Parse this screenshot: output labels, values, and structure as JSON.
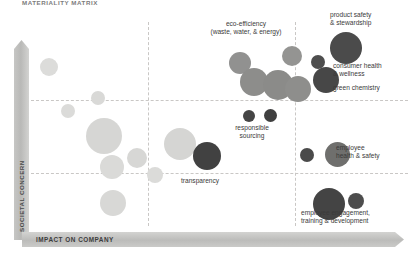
{
  "title": "MATERIALITY MATRIX",
  "axes": {
    "y_label": "SOCIETAL CONCERN",
    "x_label": "IMPACT ON COMPANY"
  },
  "chart_data": {
    "type": "scatter",
    "title": "MATERIALITY MATRIX",
    "xlabel": "IMPACT ON COMPANY",
    "ylabel": "SOCIETAL CONCERN",
    "xlim": [
      0,
      100
    ],
    "ylim": [
      0,
      100
    ],
    "grid": true,
    "gridlines": {
      "vertical": [
        32,
        70
      ],
      "horizontal": [
        38,
        62
      ]
    },
    "legend": "none",
    "size_encoding": "bubble radius = relative materiality weight",
    "color_tiers": {
      "low": "#d8d8d6",
      "medium": "#8f8f8d",
      "high": "#4c4c4c"
    },
    "points": [
      {
        "label": "",
        "x": 10,
        "y": 80,
        "r": 9,
        "tier": "low"
      },
      {
        "label": "",
        "x": 28,
        "y": 67,
        "r": 7,
        "tier": "low"
      },
      {
        "label": "",
        "x": 17,
        "y": 58,
        "r": 7,
        "tier": "low"
      },
      {
        "label": "",
        "x": 33,
        "y": 47,
        "r": 18,
        "tier": "low"
      },
      {
        "label": "",
        "x": 38,
        "y": 27,
        "r": 12,
        "tier": "low"
      },
      {
        "label": "",
        "x": 50,
        "y": 30,
        "r": 10,
        "tier": "low"
      },
      {
        "label": "",
        "x": 56,
        "y": 19,
        "r": 8,
        "tier": "low"
      },
      {
        "label": "",
        "x": 39,
        "y": 8,
        "r": 13,
        "tier": "low"
      },
      {
        "label": "",
        "x": 66,
        "y": 40,
        "r": 16,
        "tier": "low"
      },
      {
        "label": "eco-efficiency\n(waste, water, & energy)",
        "x": 50,
        "y": 74,
        "r": 11,
        "tier": "medium"
      },
      {
        "label": "",
        "x": 58,
        "y": 62,
        "r": 14,
        "tier": "medium"
      },
      {
        "label": "",
        "x": 70,
        "y": 59,
        "r": 15,
        "tier": "medium"
      },
      {
        "label": "",
        "x": 66,
        "y": 76,
        "r": 10,
        "tier": "medium"
      },
      {
        "label": "",
        "x": 79,
        "y": 53,
        "r": 13,
        "tier": "medium"
      },
      {
        "label": "responsible sourcing",
        "x": 56,
        "y": 41,
        "r": 6,
        "tier": "high"
      },
      {
        "label": "",
        "x": 64,
        "y": 41,
        "r": 7,
        "tier": "high"
      },
      {
        "label": "transparency",
        "x": 55,
        "y": 22,
        "r": 14,
        "tier": "high"
      },
      {
        "label": "product safety\n& stewardship",
        "x": 89,
        "y": 74,
        "r": 16,
        "tier": "high"
      },
      {
        "label": "consumer health\n& wellness",
        "x": 81,
        "y": 65,
        "r": 7,
        "tier": "high"
      },
      {
        "label": "green chemistry",
        "x": 75,
        "y": 56,
        "r": 13,
        "tier": "high"
      },
      {
        "label": "employee health & safety",
        "x": 91,
        "y": 39,
        "r": 12,
        "tier": "high"
      },
      {
        "label": "",
        "x": 77,
        "y": 30,
        "r": 7,
        "tier": "high"
      },
      {
        "label": "employee engagement,\ntraining & development",
        "x": 86,
        "y": 17,
        "r": 16,
        "tier": "high"
      },
      {
        "label": "",
        "x": 94,
        "y": 18,
        "r": 8,
        "tier": "high"
      }
    ]
  },
  "bubbles": [
    {
      "name": "bubble-light-1",
      "left": 40,
      "top": 58,
      "size": 18,
      "color": "#dcdcda"
    },
    {
      "name": "bubble-light-2",
      "left": 91,
      "top": 91,
      "size": 14,
      "color": "#d9d9d7"
    },
    {
      "name": "bubble-light-3",
      "left": 61,
      "top": 104,
      "size": 14,
      "color": "#dbdbd9"
    },
    {
      "name": "bubble-light-4",
      "left": 86,
      "top": 118,
      "size": 36,
      "color": "#d6d6d4"
    },
    {
      "name": "bubble-light-5",
      "left": 100,
      "top": 155,
      "size": 24,
      "color": "#dadad8"
    },
    {
      "name": "bubble-light-6",
      "left": 127,
      "top": 148,
      "size": 20,
      "color": "#d7d7d5"
    },
    {
      "name": "bubble-light-7",
      "left": 147,
      "top": 167,
      "size": 16,
      "color": "#dbdbd9"
    },
    {
      "name": "bubble-light-8",
      "left": 100,
      "top": 190,
      "size": 26,
      "color": "#d8d8d6"
    },
    {
      "name": "bubble-light-9",
      "left": 164,
      "top": 128,
      "size": 32,
      "color": "#d5d5d3"
    },
    {
      "name": "bubble-med-1",
      "left": 229,
      "top": 52,
      "size": 22,
      "color": "#919190"
    },
    {
      "name": "bubble-med-2",
      "left": 240,
      "top": 68,
      "size": 28,
      "color": "#8d8d8b"
    },
    {
      "name": "bubble-med-3",
      "left": 263,
      "top": 70,
      "size": 30,
      "color": "#8b8b89"
    },
    {
      "name": "bubble-med-4",
      "left": 282,
      "top": 46,
      "size": 20,
      "color": "#949492"
    },
    {
      "name": "bubble-med-5",
      "left": 285,
      "top": 76,
      "size": 26,
      "color": "#8e8e8c"
    },
    {
      "name": "bubble-med-6",
      "left": 325,
      "top": 142,
      "size": 25,
      "color": "#6f6f6d"
    },
    {
      "name": "bubble-dark-1",
      "left": 243,
      "top": 110,
      "size": 12,
      "color": "#454545"
    },
    {
      "name": "bubble-dark-2",
      "left": 264,
      "top": 109,
      "size": 13,
      "color": "#3f3f3f"
    },
    {
      "name": "bubble-dark-3",
      "left": 193,
      "top": 142,
      "size": 28,
      "color": "#414141"
    },
    {
      "name": "bubble-dark-4",
      "left": 330,
      "top": 32,
      "size": 32,
      "color": "#4b4b4b"
    },
    {
      "name": "bubble-dark-5",
      "left": 311,
      "top": 55,
      "size": 14,
      "color": "#4e4e4e"
    },
    {
      "name": "bubble-dark-6",
      "left": 313,
      "top": 67,
      "size": 26,
      "color": "#474747"
    },
    {
      "name": "bubble-dark-7",
      "left": 300,
      "top": 148,
      "size": 14,
      "color": "#4a4a4a"
    },
    {
      "name": "bubble-dark-8",
      "left": 313,
      "top": 188,
      "size": 32,
      "color": "#444444"
    },
    {
      "name": "bubble-dark-9",
      "left": 348,
      "top": 193,
      "size": 16,
      "color": "#4d4d4d"
    }
  ],
  "labels": [
    {
      "name": "label-eco-efficiency",
      "left": 190,
      "top": 20,
      "width": 112,
      "align": "center",
      "text": "eco-efficiency\n(waste, water, & energy)"
    },
    {
      "name": "label-product-safety",
      "left": 330,
      "top": 11,
      "width": 88,
      "align": "left",
      "text": "product safety\n& stewardship"
    },
    {
      "name": "label-consumer-health",
      "left": 333,
      "top": 62,
      "width": 86,
      "align": "left",
      "text": "consumer health\n& wellness"
    },
    {
      "name": "label-green-chemistry",
      "left": 333,
      "top": 84,
      "width": 86,
      "align": "left",
      "text": "green chemistry"
    },
    {
      "name": "label-responsible-sourcing",
      "left": 216,
      "top": 124,
      "width": 72,
      "align": "center",
      "text": "responsible\nsourcing"
    },
    {
      "name": "label-employee-health",
      "left": 336,
      "top": 144,
      "width": 82,
      "align": "left",
      "text": "employee\nhealth & safety"
    },
    {
      "name": "label-transparency",
      "left": 181,
      "top": 177,
      "width": 62,
      "align": "left",
      "text": "transparency"
    },
    {
      "name": "label-employee-engagement",
      "left": 301,
      "top": 209,
      "width": 116,
      "align": "left",
      "text": "employee engagement,\ntraining & development"
    }
  ],
  "gridlines": {
    "vertical": [
      122,
      269
    ],
    "horizontal": [
      78,
      151
    ]
  }
}
